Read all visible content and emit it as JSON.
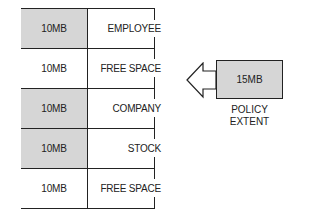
{
  "diagram": {
    "rows": [
      {
        "size": "10MB",
        "label": "EMPLOYEE",
        "shaded": true
      },
      {
        "size": "10MB",
        "label": "FREE SPACE",
        "shaded": false
      },
      {
        "size": "10MB",
        "label": "COMPANY",
        "shaded": true
      },
      {
        "size": "10MB",
        "label": "STOCK",
        "shaded": true
      },
      {
        "size": "10MB",
        "label": "FREE SPACE",
        "shaded": false
      }
    ],
    "policy": {
      "size": "15MB",
      "caption_line1": "POLICY",
      "caption_line2": "EXTENT"
    },
    "arrow": {
      "direction": "left",
      "target_row": "FREE SPACE"
    },
    "colors": {
      "shade": "#d6d6d6",
      "line": "#222222"
    }
  }
}
